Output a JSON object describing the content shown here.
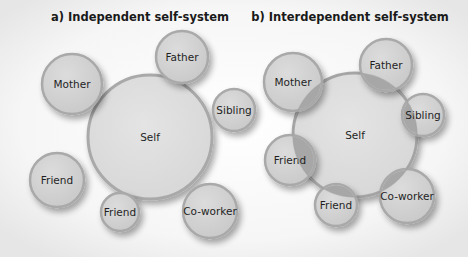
{
  "colors": {
    "background": "#f4f4f4",
    "circle_fill": "#d3d3d3",
    "circle_stroke": "#a9a9a9",
    "self_fill": "#dedede",
    "overlap_fill": "#a7a7a7",
    "text": "#1f1f1f"
  },
  "panels": [
    {
      "id": "independent",
      "title": "a) Independent self-system",
      "title_pos": [
        140,
        21
      ],
      "self": {
        "label": "Self",
        "cx": 150,
        "cy": 137,
        "r": 62
      },
      "others": [
        {
          "label": "Mother",
          "cx": 72,
          "cy": 84,
          "r": 30
        },
        {
          "label": "Father",
          "cx": 182,
          "cy": 57,
          "r": 26
        },
        {
          "label": "Sibling",
          "cx": 234,
          "cy": 110,
          "r": 21
        },
        {
          "label": "Friend",
          "cx": 57,
          "cy": 180,
          "r": 27
        },
        {
          "label": "Friend",
          "cx": 120,
          "cy": 212,
          "r": 19
        },
        {
          "label": "Co-worker",
          "cx": 210,
          "cy": 211,
          "r": 27
        }
      ]
    },
    {
      "id": "interdependent",
      "title": "b) Interdependent self-system",
      "title_pos": [
        350,
        21
      ],
      "self": {
        "label": "Self",
        "cx": 355,
        "cy": 135,
        "r": 62
      },
      "others": [
        {
          "label": "Mother",
          "cx": 293,
          "cy": 82,
          "r": 29
        },
        {
          "label": "Father",
          "cx": 386,
          "cy": 65,
          "r": 26
        },
        {
          "label": "Sibling",
          "cx": 423,
          "cy": 115,
          "r": 21
        },
        {
          "label": "Friend",
          "cx": 290,
          "cy": 160,
          "r": 25
        },
        {
          "label": "Friend",
          "cx": 336,
          "cy": 205,
          "r": 21
        },
        {
          "label": "Co-worker",
          "cx": 407,
          "cy": 196,
          "r": 27
        }
      ]
    }
  ]
}
